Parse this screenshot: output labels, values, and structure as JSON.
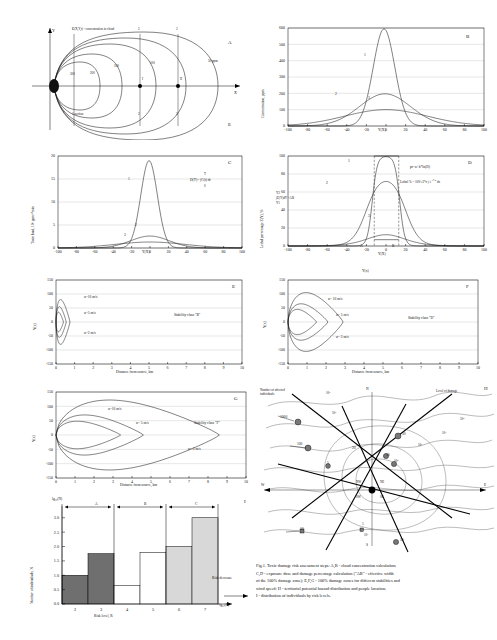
{
  "figure": {
    "id": "fig-1",
    "caption_lines": [
      "Fig.1. Toxic damage risk assessment steps: A,B - cloud concentration calculation;",
      "C,D - exposure dose and damage percentage calculation (\"AB\" - effective width",
      "of the 100% damage zone); E,F,G - 100%  damage zones for different stabilities  and",
      "wind speed; H - territorial potential hazard distribution and people location;",
      "I - distribution of individuals  by  risk levels."
    ]
  },
  "panels": {
    "A": {
      "id": "A",
      "id2": "E",
      "note": "C(X,Y,t) - concentration in cloud",
      "axis_y": "Y",
      "axis_x": "X",
      "section_label": "1 section",
      "section_top": [
        "1",
        "2",
        "3"
      ],
      "section_bottom": [
        "1",
        "2",
        "3"
      ],
      "contour_labels": [
        "300",
        "200",
        "100",
        "50 ppm"
      ],
      "points": [
        "I",
        "II"
      ]
    },
    "B": {
      "id": "B",
      "chart_data": {
        "type": "line",
        "title": "",
        "xlabel": "Y(X)",
        "ylabel": "Concentration, ppm",
        "xticks": [
          -100,
          -80,
          -60,
          -40,
          -20,
          0,
          20,
          40,
          60,
          80,
          100
        ],
        "yticks": [
          0,
          100,
          200,
          300,
          400,
          500,
          600
        ],
        "xlim": [
          -100,
          100
        ],
        "ylim": [
          0,
          600
        ],
        "grid": true,
        "series": [
          {
            "name": "1",
            "peak": 595,
            "sigma": 11,
            "center": -2
          },
          {
            "name": "2",
            "peak": 197,
            "sigma": 26,
            "center": -1
          },
          {
            "name": "3",
            "peak": 100,
            "sigma": 42,
            "center": 0
          }
        ],
        "annotations": [
          "1",
          "2",
          "3"
        ]
      }
    },
    "C": {
      "id": "C",
      "formula": "D(T)= ∫C(t) dt",
      "formula_upper": "T",
      "formula_lower": "0",
      "chart_data": {
        "type": "line",
        "xlabel": "Y(X)",
        "ylabel": "Toxic load, 10⁵ ppmⁿ*min",
        "xticks": [
          -100,
          -80,
          -60,
          -40,
          -20,
          0,
          20,
          40,
          60,
          80,
          100
        ],
        "yticks": [
          0,
          5,
          10,
          15,
          20
        ],
        "xlim": [
          -100,
          100
        ],
        "ylim": [
          0,
          20
        ],
        "grid": true,
        "series": [
          {
            "name": "1",
            "peak": 19,
            "sigma": 9,
            "center": -1
          },
          {
            "name": "2",
            "peak": 2.6,
            "sigma": 21,
            "center": 0
          },
          {
            "name": "3",
            "peak": 1.3,
            "sigma": 38,
            "center": 0
          }
        ],
        "annotations": [
          "1",
          "2",
          "3"
        ]
      }
    },
    "D": {
      "id": "D",
      "formula1": "pr=a+b*ln(D)",
      "formula2_head": "Lethal % =",
      "formula2_frac_top": "100",
      "formula2_frac_bot": "√2*π",
      "formula2_int_upper": "pr",
      "formula2_int_lower": "-∞",
      "formula2_body": "e",
      "formula2_exp": "-x²/2",
      "formula2_tail": "dx",
      "formula3": "∫Z(Y)dY =AB",
      "formula3_upper": "Y2",
      "formula3_lower": "Y1",
      "marker_a": "A",
      "marker_b": "B",
      "chart_data": {
        "type": "line",
        "xlabel": "Y(X)",
        "ylabel": "Lethal percentage Z(Y), %",
        "xticks": [
          -100,
          -80,
          -60,
          -40,
          -20,
          0,
          20,
          40,
          60,
          80,
          100
        ],
        "yticks": [
          0,
          20,
          40,
          60,
          80,
          100
        ],
        "xlim": [
          -100,
          100
        ],
        "ylim": [
          0,
          100
        ],
        "grid": true,
        "series": [
          {
            "name": "1",
            "plateau": 100,
            "halfwidth": 14,
            "edge": 8
          },
          {
            "name": "2",
            "plateau": 80,
            "halfwidth": 20,
            "edge": 22
          },
          {
            "name": "3",
            "plateau": 33,
            "halfwidth": 10,
            "edge": 40
          }
        ],
        "annotations": [
          "1",
          "2",
          "3"
        ],
        "ab_interval": [
          -12,
          13
        ]
      }
    },
    "E": {
      "id": "E",
      "stability": "Stability class  \"B\"",
      "speed_labels": [
        "u=10 m/s",
        "u=5 m/s",
        "u=2 m/s"
      ],
      "chart_data": {
        "type": "line",
        "xlabel": "Distance from source, km",
        "ylabel": "Y(x)",
        "xticks": [
          0,
          1,
          2,
          3,
          4,
          5,
          6,
          7,
          8,
          9,
          10
        ],
        "yticks": [
          -150,
          -100,
          -50,
          0,
          50,
          100,
          150
        ],
        "xlim": [
          0,
          10
        ],
        "ylim": [
          -150,
          150
        ],
        "grid": true,
        "zones": [
          {
            "name": "u=10 m/s",
            "length": 0.75,
            "width": 80
          },
          {
            "name": "u=5 m/s",
            "length": 0.55,
            "width": 55
          },
          {
            "name": "u=2 m/s",
            "length": 0.4,
            "width": 35
          }
        ]
      }
    },
    "F": {
      "id": "F",
      "stability": "Stability class  \"D\"",
      "speed_labels": [
        "u= 10 m/s",
        "u= 5 m/s",
        "u= 2 m/s"
      ],
      "axis_top_label": "Y(x)",
      "chart_data": {
        "type": "line",
        "xlabel": "Distance from source, km",
        "ylabel": "Y(x)",
        "xticks": [
          0,
          1,
          2,
          3,
          4,
          5,
          6,
          7,
          8,
          9,
          10
        ],
        "yticks": [
          -150,
          -100,
          -50,
          0,
          50,
          100,
          150
        ],
        "xlim": [
          0,
          10
        ],
        "ylim": [
          -150,
          150
        ],
        "grid": true,
        "zones": [
          {
            "name": "u= 10 m/s",
            "length": 2.9,
            "width": 105
          },
          {
            "name": "u= 5 m/s",
            "length": 2.1,
            "width": 65
          },
          {
            "name": "u= 2 m/s",
            "length": 1.5,
            "width": 45
          }
        ]
      }
    },
    "G": {
      "id": "G",
      "stability": "Stability class  \"F\"",
      "speed_labels": [
        "u=10 m/s",
        "u= 5 m/s",
        "u= 2 m/s"
      ],
      "chart_data": {
        "type": "line",
        "xlabel": "Distance from source, km",
        "ylabel": "Y(x)",
        "xticks": [
          0,
          1,
          2,
          3,
          4,
          5,
          6,
          7,
          8,
          9,
          10
        ],
        "yticks": [
          -150,
          -100,
          -50,
          0,
          50,
          100,
          150
        ],
        "xlim": [
          0,
          10
        ],
        "ylim": [
          -150,
          150
        ],
        "grid": true,
        "zones": [
          {
            "name": "u=10 m/s",
            "length": 8.6,
            "width": 122
          },
          {
            "name": "u= 5 m/s",
            "length": 4.6,
            "width": 70
          },
          {
            "name": "u= 2 m/s",
            "length": 3.4,
            "width": 48
          }
        ]
      }
    },
    "H": {
      "id": "H",
      "legend_left": "Number of affected individuals",
      "legend_right": "Level of damage",
      "compass": [
        "N",
        "S",
        "E",
        "W"
      ],
      "compass_minor": [
        "NE",
        "SE",
        "SW",
        "NW",
        "NNE",
        "NNW",
        "SSE",
        "SSW"
      ],
      "population_labels": [
        "1000",
        "100",
        "50",
        "20",
        "10",
        "10",
        "5",
        "1",
        "50"
      ],
      "damage_levels": [
        "10⁷",
        "10⁶",
        "10⁵",
        "10⁴",
        "10³",
        "10²",
        "10¹"
      ]
    },
    "I": {
      "id": "I",
      "y_axis_top": "lg₁₀(N)",
      "x_axis_right": "-lg₁₀(R)",
      "risk_decrease": "Risk decrease",
      "group_labels": [
        "A",
        "B",
        "C"
      ],
      "chart_data": {
        "type": "bar",
        "title": "",
        "xlabel": "Risk level, R",
        "ylabel": "Number of individuals, N",
        "categories": [
          "2",
          "3",
          "4",
          "5",
          "6",
          "7"
        ],
        "values": [
          1.0,
          1.75,
          0.65,
          1.8,
          2.0,
          3.0
        ],
        "groups": [
          "A",
          "A",
          "B",
          "B",
          "C",
          "C"
        ],
        "yticks": [
          0.0,
          0.5,
          1.0,
          1.5,
          2.0,
          2.5,
          3.0
        ],
        "ylim": [
          0,
          3.2
        ],
        "grid": false
      }
    }
  }
}
